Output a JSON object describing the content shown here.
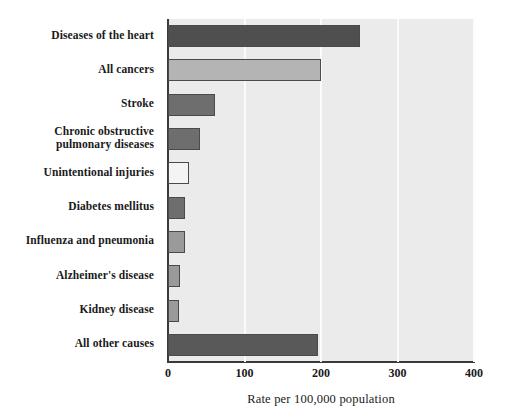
{
  "chart_data": {
    "type": "bar",
    "orientation": "horizontal",
    "title": "",
    "xlabel": "Rate per 100,000 population",
    "ylabel": "",
    "xlim": [
      0,
      400
    ],
    "xticks": [
      0,
      100,
      200,
      300,
      400
    ],
    "xtick_labels": [
      "0",
      "100",
      "200",
      "300",
      "400"
    ],
    "grid": true,
    "grid_axis": "x",
    "legend": "none",
    "categories": [
      "Diseases of the heart",
      "All cancers",
      "Stroke",
      "Chronic obstructive\npulmonary diseases",
      "Unintentional injuries",
      "Diabetes mellitus",
      "Influenza and pneumonia",
      "Alzheimer's disease",
      "Kidney disease",
      "All other causes"
    ],
    "values": [
      251,
      200,
      61,
      42,
      28,
      22,
      22,
      16,
      14,
      196
    ],
    "bar_colors": [
      "#4f4f4f",
      "#b4b4b4",
      "#6e6e6e",
      "#6e6e6e",
      "#f4f4f4",
      "#6e6e6e",
      "#9a9a9a",
      "#9a9a9a",
      "#9a9a9a",
      "#595959"
    ],
    "bar_edge_color": "#4a4a4a",
    "plot_background": "#ebebeb",
    "gridline_color": "#fbfbfb",
    "axis_color": "#3a3a3a"
  }
}
